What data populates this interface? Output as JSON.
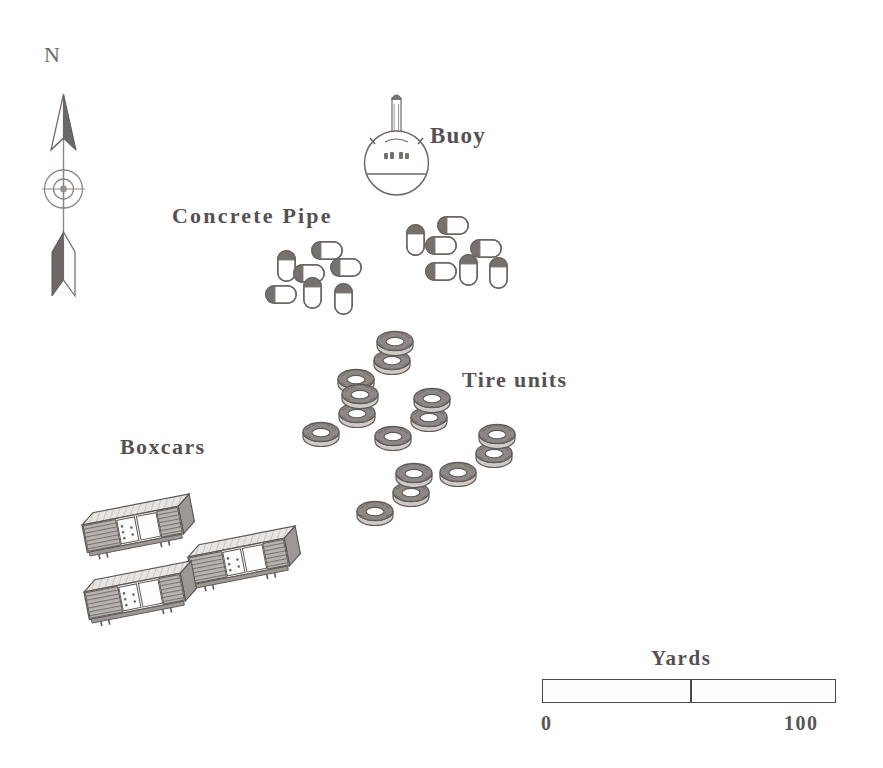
{
  "map": {
    "width": 883,
    "height": 768,
    "background": "#ffffff",
    "ink_color": "#55514f",
    "fill_light": "#fdfdfd",
    "fill_dark": "#6f6a68",
    "fill_mid": "#a8a3a0"
  },
  "compass": {
    "label": "N",
    "label_x": 44,
    "label_y": 52,
    "arrow_x": 63,
    "arrow_top_y": 96,
    "arrow_bottom_y": 290,
    "icon_name": "north-arrow-icon"
  },
  "labels": {
    "buoy": {
      "text": "Buoy",
      "x": 430,
      "y": 123
    },
    "concrete_pipe": {
      "text": "Concrete Pipe",
      "x": 172,
      "y": 203
    },
    "tire_units": {
      "text": "Tire units",
      "x": 462,
      "y": 367
    },
    "boxcars": {
      "text": "Boxcars",
      "x": 120,
      "y": 434
    }
  },
  "buoy": {
    "cx": 396,
    "cy": 163,
    "r": 33,
    "mast_top_y": 96,
    "mast_width": 9,
    "waterline_offset": 16
  },
  "concrete_pipes": [
    {
      "x": 277,
      "y": 250,
      "w": 19,
      "h": 32,
      "orient": "v"
    },
    {
      "x": 311,
      "y": 241,
      "w": 32,
      "h": 19,
      "orient": "h"
    },
    {
      "x": 293,
      "y": 264,
      "w": 32,
      "h": 19,
      "orient": "h"
    },
    {
      "x": 330,
      "y": 258,
      "w": 32,
      "h": 19,
      "orient": "h"
    },
    {
      "x": 265,
      "y": 285,
      "w": 32,
      "h": 19,
      "orient": "h"
    },
    {
      "x": 303,
      "y": 277,
      "w": 19,
      "h": 32,
      "orient": "v"
    },
    {
      "x": 334,
      "y": 283,
      "w": 19,
      "h": 32,
      "orient": "v"
    },
    {
      "x": 406,
      "y": 224,
      "w": 19,
      "h": 32,
      "orient": "v"
    },
    {
      "x": 437,
      "y": 216,
      "w": 32,
      "h": 19,
      "orient": "h"
    },
    {
      "x": 425,
      "y": 236,
      "w": 32,
      "h": 19,
      "orient": "h"
    },
    {
      "x": 470,
      "y": 239,
      "w": 32,
      "h": 19,
      "orient": "h"
    },
    {
      "x": 425,
      "y": 262,
      "w": 32,
      "h": 19,
      "orient": "h"
    },
    {
      "x": 459,
      "y": 254,
      "w": 19,
      "h": 32,
      "orient": "v"
    },
    {
      "x": 489,
      "y": 257,
      "w": 19,
      "h": 32,
      "orient": "v"
    }
  ],
  "tire_units": [
    {
      "x": 395,
      "y": 341
    },
    {
      "x": 360,
      "y": 394
    },
    {
      "x": 432,
      "y": 398
    },
    {
      "x": 497,
      "y": 434
    },
    {
      "x": 414,
      "y": 473
    }
  ],
  "tire_unit_geometry": {
    "ring_rx": 17,
    "ring_ry": 9,
    "ring_inner_rx": 9,
    "ring_inner_ry": 4,
    "ring_thickness": 5,
    "offset_1_x": -3,
    "offset_1_y": 19,
    "offset_2_x": -39,
    "offset_2_y": 38
  },
  "boxcars": [
    {
      "x": 82,
      "y": 509,
      "angle": -11
    },
    {
      "x": 188,
      "y": 541,
      "angle": -11
    },
    {
      "x": 84,
      "y": 576,
      "angle": -11
    }
  ],
  "boxcar_geometry": {
    "length": 98,
    "body_height": 28,
    "depth_x": 13,
    "depth_y": -10
  },
  "scale_bar": {
    "title": "Yards",
    "title_x": 651,
    "title_y": 646,
    "x": 542,
    "y": 679,
    "width": 294,
    "height": 24,
    "divider_fraction": 0.5,
    "start_label": "0",
    "start_label_x": 541,
    "end_label": "100",
    "end_label_x": 784,
    "labels_y": 712
  }
}
